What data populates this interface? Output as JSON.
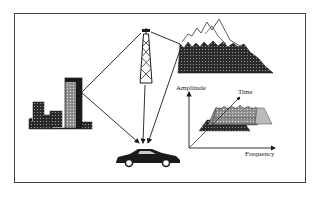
{
  "diagram": {
    "title": "",
    "nodes": [
      {
        "id": "tower",
        "icon": "radio-tower-icon"
      },
      {
        "id": "buildings",
        "icon": "city-buildings-icon"
      },
      {
        "id": "mountains",
        "icon": "mountain-range-icon"
      },
      {
        "id": "car",
        "icon": "car-icon"
      }
    ],
    "paths": [
      {
        "from": "tower",
        "to": "buildings"
      },
      {
        "from": "buildings",
        "to": "car"
      },
      {
        "from": "tower",
        "to": "car"
      },
      {
        "from": "tower",
        "to": "mountains"
      },
      {
        "from": "mountains",
        "to": "car"
      }
    ],
    "inset": {
      "y_axis_label": "Amplitude",
      "x_axis_label": "Frequency",
      "depth_axis_label": "Time"
    }
  },
  "colors": {
    "ink": "#1a1a1a",
    "frame": "#444444",
    "background": "#ffffff"
  }
}
